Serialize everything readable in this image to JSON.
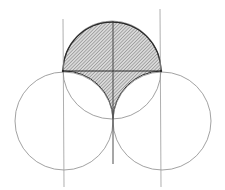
{
  "figure": {
    "shaded_fill_color": "#b8b8b8",
    "line_color": "#8a8a8a",
    "dark_line_color": "#2a2a2a",
    "background_color": "#ffffff"
  }
}
